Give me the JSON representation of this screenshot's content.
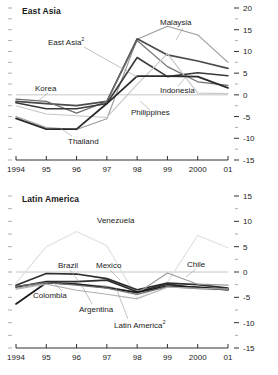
{
  "figure": {
    "width": 278,
    "height": 375,
    "background": "#ffffff"
  },
  "chart_data": [
    {
      "type": "line",
      "title": "East Asia",
      "xlabel": "",
      "ylabel": "",
      "x": [
        1994,
        1995,
        1996,
        1997,
        1998,
        1999,
        2000,
        2001
      ],
      "tick_labels_x": [
        "1994",
        "95",
        "96",
        "97",
        "98",
        "99",
        "2000",
        "01"
      ],
      "tick_labels_y": [
        "20",
        "15",
        "10",
        "5",
        "0",
        "-5",
        "-10",
        "-15"
      ],
      "tick_values_y": [
        20,
        15,
        10,
        5,
        0,
        -5,
        -10,
        -15
      ],
      "ylim": [
        -15,
        20
      ],
      "y_axis_position": "right",
      "grid": false,
      "zero_line": true,
      "legend": "inline-annotations",
      "series": [
        {
          "name": "Malaysia",
          "color": "#9a9a9a",
          "width": 1.1,
          "values": [
            -5.0,
            -7.5,
            -8.0,
            -5.5,
            12.8,
            15.8,
            13.8,
            7.5
          ]
        },
        {
          "name": "East Asia",
          "label": "East Asia²",
          "color": "#4a4a4a",
          "width": 1.7,
          "values": [
            -1.5,
            -2.0,
            -2.5,
            -1.5,
            12.9,
            9.2,
            7.8,
            6.1
          ]
        },
        {
          "name": "Korea",
          "color": "#6e6e6e",
          "width": 1.2,
          "values": [
            -1.0,
            -1.5,
            -4.2,
            -1.5,
            12.5,
            6.5,
            3.0,
            2.2
          ]
        },
        {
          "name": "Indonesia",
          "color": "#3a3a3a",
          "width": 1.6,
          "values": [
            -1.8,
            -3.2,
            -3.2,
            -2.0,
            8.6,
            4.2,
            5.1,
            4.4
          ]
        },
        {
          "name": "Philippines",
          "color": "#c6c6c6",
          "width": 1.1,
          "values": [
            -2.5,
            -4.4,
            -4.8,
            -5.2,
            2.4,
            9.5,
            0.4,
            0.3
          ]
        },
        {
          "name": "Thailand",
          "color": "#2a2a2a",
          "width": 1.8,
          "values": [
            -5.4,
            -7.9,
            -7.9,
            -2.0,
            4.3,
            4.3,
            4.2,
            1.6
          ]
        }
      ],
      "annotations": [
        {
          "text": "Malaysia",
          "x_px": 160,
          "y_px": 18
        },
        {
          "text": "East Asia²",
          "x_px": 48,
          "y_px": 38
        },
        {
          "text": "Korea",
          "x_px": 35,
          "y_px": 84
        },
        {
          "text": "Indonesia",
          "x_px": 160,
          "y_px": 86
        },
        {
          "text": "Philippines",
          "x_px": 131,
          "y_px": 108
        },
        {
          "text": "Thailand",
          "x_px": 68,
          "y_px": 137
        }
      ]
    },
    {
      "type": "line",
      "title": "Latin America",
      "xlabel": "",
      "ylabel": "",
      "x": [
        1994,
        1995,
        1996,
        1997,
        1998,
        1999,
        2000,
        2001
      ],
      "tick_labels_x": [
        "1994",
        "95",
        "96",
        "97",
        "98",
        "99",
        "2000",
        "01"
      ],
      "tick_labels_y": [
        "15",
        "10",
        "5",
        "0",
        "-5",
        "-10",
        "-15"
      ],
      "tick_values_y": [
        15,
        10,
        5,
        0,
        -5,
        -10,
        -15
      ],
      "ylim": [
        -15,
        15
      ],
      "y_axis_position": "right",
      "grid": false,
      "zero_line": true,
      "legend": "inline-annotations",
      "series": [
        {
          "name": "Venezuela",
          "color": "#e0e0e0",
          "width": 1.1,
          "values": [
            -2.2,
            5.0,
            8.0,
            5.2,
            -5.2,
            -2.0,
            7.2,
            4.8
          ]
        },
        {
          "name": "Brazil",
          "color": "#2e2e2e",
          "width": 1.7,
          "values": [
            -2.6,
            -0.3,
            -0.4,
            -1.3,
            -3.5,
            -2.2,
            -2.5,
            -3.2
          ]
        },
        {
          "name": "Mexico",
          "color": "#2e2e2e",
          "width": 1.7,
          "values": [
            -3.0,
            -1.9,
            -1.9,
            -1.6,
            -3.9,
            -2.4,
            -3.2,
            -3.4
          ]
        },
        {
          "name": "Chile",
          "color": "#9a9a9a",
          "width": 1.1,
          "values": [
            -3.2,
            -2.2,
            -2.4,
            -2.8,
            -4.2,
            -0.2,
            -2.4,
            -2.6
          ]
        },
        {
          "name": "Colombia",
          "color": "#1c1c1c",
          "width": 1.8,
          "values": [
            -6.3,
            -2.1,
            -2.4,
            -3.1,
            -4.0,
            -2.8,
            -3.0,
            -3.5
          ]
        },
        {
          "name": "Argentina",
          "color": "#6e6e6e",
          "width": 1.3,
          "values": [
            -2.8,
            -2.1,
            -2.6,
            -3.2,
            -4.4,
            -2.9,
            -3.3,
            -3.3
          ]
        },
        {
          "name": "Latin America",
          "label": "Latin America²",
          "color": "#b0b0b0",
          "width": 1.1,
          "values": [
            -3.4,
            -2.4,
            -3.6,
            -4.4,
            -5.3,
            -3.0,
            -3.2,
            -3.4
          ]
        }
      ],
      "annotations": [
        {
          "text": "Venezuela",
          "x_px": 97,
          "y_px": 28
        },
        {
          "text": "Brazil",
          "x_px": 58,
          "y_px": 73
        },
        {
          "text": "Mexico",
          "x_px": 96,
          "y_px": 73
        },
        {
          "text": "Chile",
          "x_px": 187,
          "y_px": 72
        },
        {
          "text": "Colombia",
          "x_px": 33,
          "y_px": 103
        },
        {
          "text": "Argentina",
          "x_px": 79,
          "y_px": 117
        },
        {
          "text": "Latin America²",
          "x_px": 114,
          "y_px": 133
        }
      ]
    }
  ]
}
